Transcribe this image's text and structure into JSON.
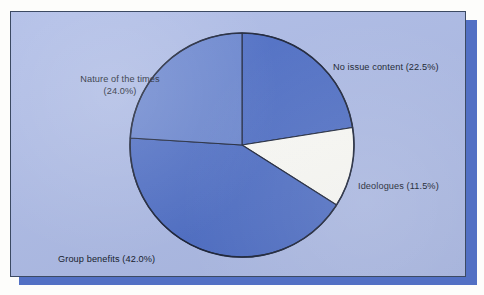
{
  "figure": {
    "background_color": "#adbbe6",
    "page_color": "#fdfdfb",
    "shadow_color": "#5270c4",
    "border_color": "#3c4a63"
  },
  "chart_data": {
    "type": "pie",
    "title": "",
    "subtitle": "",
    "xlabel": "",
    "ylabel": "",
    "grid": false,
    "legend_position": "none",
    "label_format": "{name} ({value}%)",
    "start_angle_deg": 90,
    "direction": "clockwise",
    "center": {
      "x": 241,
      "y": 144
    },
    "radius": 112,
    "categories": [
      "No issue content",
      "Ideologues",
      "Group benefits",
      "Nature of the times"
    ],
    "values": [
      22.5,
      11.5,
      42.0,
      24.0
    ],
    "colors": [
      "#4f6fc6",
      "#fbfbf7",
      "#4f6fc6",
      "#6a86d0"
    ],
    "slices": [
      {
        "name": "No issue content",
        "value": 22.5,
        "label": "No issue content (22.5%)",
        "color": "#4f6fc6",
        "start_deg": 0.0,
        "end_deg": 81.0
      },
      {
        "name": "Ideologues",
        "value": 11.5,
        "label": "Ideologues (11.5%)",
        "color": "#fbfbf7",
        "start_deg": 81.0,
        "end_deg": 122.4
      },
      {
        "name": "Group benefits",
        "value": 42.0,
        "label": "Group benefits (42.0%)",
        "color": "#4f6fc6",
        "start_deg": 122.4,
        "end_deg": 273.6
      },
      {
        "name": "Nature of the times",
        "value": 24.0,
        "label_line1": "Nature of the times",
        "label_line2": "(24.0%)",
        "label": "Nature of the times (24.0%)",
        "color": "#6a86d0",
        "start_deg": 273.6,
        "end_deg": 360.0
      }
    ]
  },
  "labels": {
    "no_issue_content": "No issue content (22.5%)",
    "ideologues": "Ideologues (11.5%)",
    "group_benefits": "Group benefits (42.0%)",
    "nature_of_the_times_line1": "Nature of the times",
    "nature_of_the_times_line2": "(24.0%)"
  }
}
